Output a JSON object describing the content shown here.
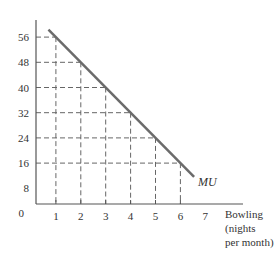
{
  "chart_data": {
    "type": "line",
    "title": "",
    "xlabel": "Bowling (nights per month)",
    "xlabel_lines": [
      "Bowling",
      "(nights",
      "per month)"
    ],
    "ylabel": "",
    "origin_label": "0",
    "x_ticks": [
      "1",
      "2",
      "3",
      "4",
      "5",
      "6",
      "7"
    ],
    "y_ticks": [
      "8",
      "16",
      "24",
      "32",
      "40",
      "48",
      "56"
    ],
    "xlim": [
      0,
      7
    ],
    "ylim": [
      0,
      58
    ],
    "series": [
      {
        "name": "MU",
        "x": [
          1,
          2,
          3,
          4,
          5,
          6
        ],
        "values": [
          56,
          48,
          40,
          32,
          24,
          16
        ]
      }
    ],
    "curve_label": "MU",
    "dashed_guides": true,
    "colors": {
      "curve": "#6b6b6b",
      "axis": "#555555",
      "guides": "#666666"
    }
  }
}
